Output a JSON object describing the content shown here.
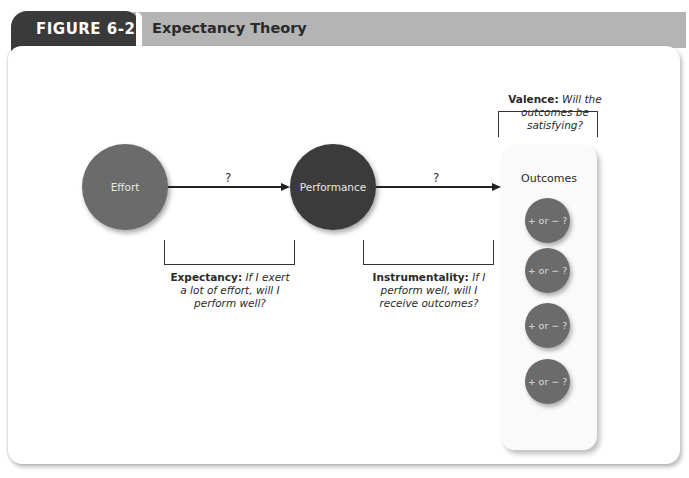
{
  "header": {
    "figure_label": "FIGURE 6-2",
    "title": "Expectancy Theory"
  },
  "colors": {
    "figure_tab": "#3a3a3a",
    "header_band": "#b4b4b4",
    "effort_circle": "#6b6b6b",
    "performance_circle": "#3b3b3b",
    "outcome_circle": "#6b6b6b"
  },
  "nodes": {
    "effort": "Effort",
    "performance": "Performance",
    "outcomes": "Outcomes"
  },
  "arrows": {
    "effort_to_performance": "?",
    "performance_to_outcomes": "?"
  },
  "outcome_items": [
    {
      "label": "+ or − ?"
    },
    {
      "label": "+ or − ?"
    },
    {
      "label": "+ or − ?"
    },
    {
      "label": "+ or − ?"
    }
  ],
  "captions": {
    "expectancy": {
      "term": "Expectancy:",
      "line1": "If I exert",
      "line2": "a lot of effort, will I",
      "line3": "perform well?"
    },
    "instrumentality": {
      "term": "Instrumentality:",
      "line1": "If I",
      "line2": "perform well, will I",
      "line3": "receive outcomes?"
    },
    "valence": {
      "term": "Valence:",
      "line1": "Will the",
      "line2": "outcomes be",
      "line3": "satisfying?"
    }
  }
}
